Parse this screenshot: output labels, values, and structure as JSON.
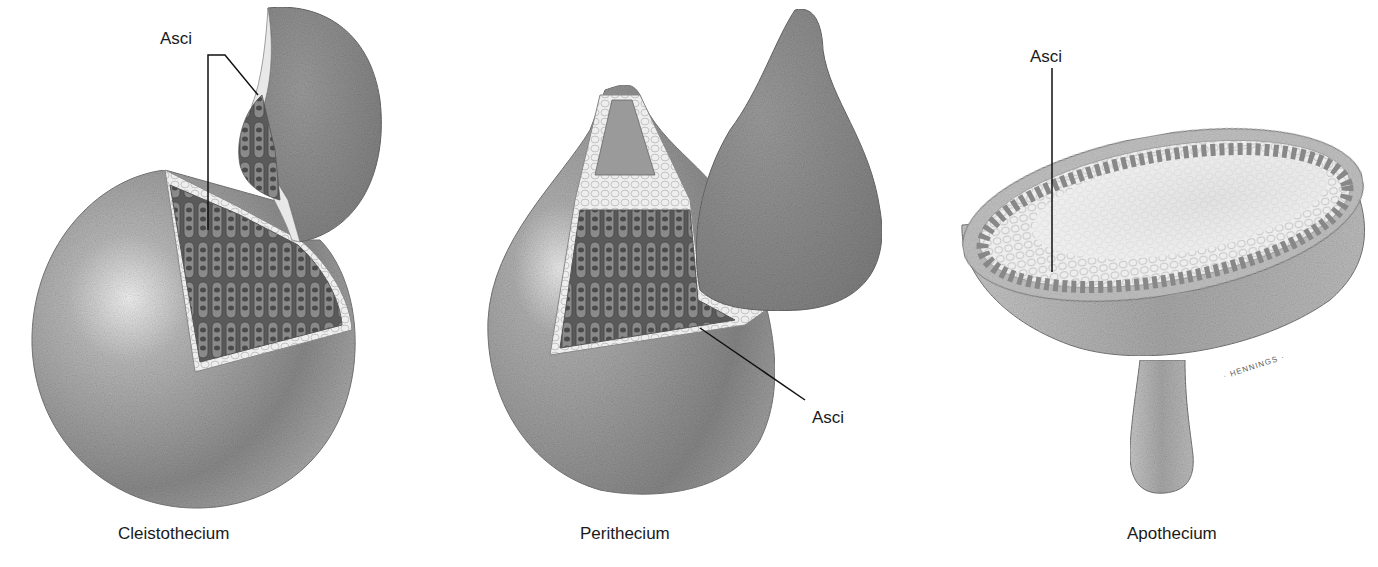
{
  "figure": {
    "panels": [
      {
        "id": "cleistothecium",
        "caption": "Cleistothecium",
        "labels": [
          {
            "text": "Asci"
          }
        ]
      },
      {
        "id": "perithecium",
        "caption": "Perithecium",
        "labels": [
          {
            "text": "Asci"
          }
        ]
      },
      {
        "id": "apothecium",
        "caption": "Apothecium",
        "labels": [
          {
            "text": "Asci"
          }
        ],
        "signature": "· HENNINGS ·"
      }
    ]
  }
}
